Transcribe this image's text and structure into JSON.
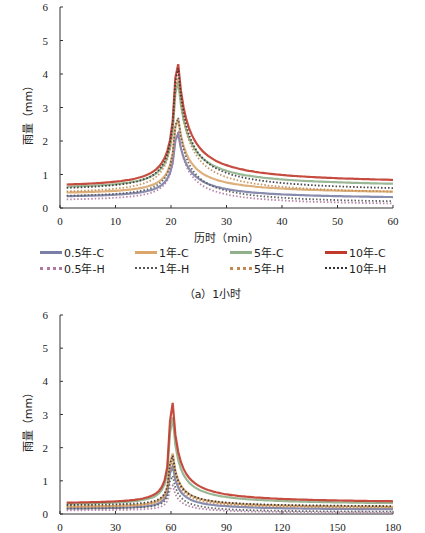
{
  "chart_data": [
    {
      "type": "line",
      "title": "(a) 1小时",
      "xlabel": "历时（min）",
      "ylabel": "雨量（mm）",
      "xlim": [
        0,
        60
      ],
      "ylim": [
        0,
        6
      ],
      "xticks": [
        0,
        10,
        20,
        30,
        40,
        50,
        60
      ],
      "yticks": [
        0,
        1,
        2,
        3,
        4,
        5,
        6
      ],
      "peak_x": 21,
      "series": [
        {
          "name": "0.5年-C",
          "color": "#7b7fa6",
          "style": "solid",
          "peak": 2.6,
          "start": 0.3,
          "end": 0.25
        },
        {
          "name": "1年-C",
          "color": "#d9a66b",
          "style": "solid",
          "peak": 3.1,
          "start": 0.4,
          "end": 0.4
        },
        {
          "name": "5年-C",
          "color": "#8fb08a",
          "style": "solid",
          "peak": 4.4,
          "start": 0.55,
          "end": 0.6
        },
        {
          "name": "10年-C",
          "color": "#c0392b",
          "style": "solid",
          "peak": 5.0,
          "start": 0.6,
          "end": 0.7
        },
        {
          "name": "0.5年-H",
          "color": "#b07aa0",
          "style": "dotted",
          "peak": 2.7,
          "start": 0.2,
          "end": 0.05
        },
        {
          "name": "1年-H",
          "color": "#555555",
          "style": "dotted",
          "peak": 3.2,
          "start": 0.3,
          "end": 0.1
        },
        {
          "name": "5年-H",
          "color": "#c08a50",
          "style": "dotted",
          "peak": 4.6,
          "start": 0.4,
          "end": 0.35
        },
        {
          "name": "10年-H",
          "color": "#333333",
          "style": "dotted",
          "peak": 4.9,
          "start": 0.5,
          "end": 0.45
        }
      ],
      "legend_position": "below"
    },
    {
      "type": "line",
      "title": "",
      "xlabel": "",
      "ylabel": "雨量（mm）",
      "xlim": [
        0,
        180
      ],
      "ylim": [
        0,
        6
      ],
      "xticks": [
        0,
        30,
        60,
        90,
        120,
        150,
        180
      ],
      "yticks": [
        0,
        1,
        2,
        3,
        4,
        5,
        6
      ],
      "peak_x": 60,
      "series": [
        {
          "name": "0.5年-C",
          "peak": 2.0
        },
        {
          "name": "1年-C",
          "peak": 2.5
        },
        {
          "name": "5年-C",
          "peak": 4.0
        },
        {
          "name": "10年-C",
          "peak": 4.6
        },
        {
          "name": "0.5年-H",
          "peak": 1.2
        },
        {
          "name": "1年-H",
          "peak": 1.6
        },
        {
          "name": "5年-H",
          "peak": 2.2
        },
        {
          "name": "10年-H",
          "peak": 2.4
        }
      ]
    }
  ],
  "legend": {
    "row1": [
      "0.5年-C",
      "1年-C",
      "5年-C",
      "10年-C"
    ],
    "row2": [
      "0.5年-H",
      "1年-H",
      "5年-H",
      "10年-H"
    ]
  },
  "labels": {
    "ylabel": "雨量（mm）",
    "xlabel1": "历时（min）",
    "caption1": "（a）1小时"
  }
}
